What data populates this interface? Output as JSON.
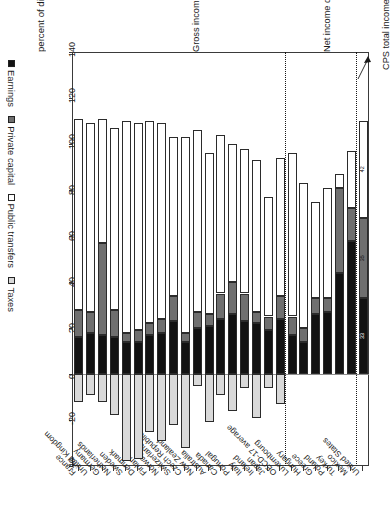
{
  "chart_data": {
    "type": "bar",
    "orientation": "horizontal-stacked",
    "title": "",
    "xlabel": "percent of disposable income",
    "ylabel": "",
    "xlim": [
      -40,
      140
    ],
    "xticks": [
      140,
      120,
      100,
      80,
      60,
      40,
      20,
      0,
      -20,
      -40
    ],
    "grid": false,
    "legend_position": "bottom",
    "legend": [
      "Earnings",
      "Private capital",
      "Public transfers",
      "Taxes"
    ],
    "colors": {
      "earnings": "#121212",
      "private_capital": "#6f6f6f",
      "public_transfers": "#ffffff",
      "taxes": "#d9d9d9"
    },
    "categories": [
      "United States",
      "Mexico",
      "Turkey",
      "Poland",
      "Greece",
      "Hungary",
      "Luxembourg",
      "OECD-17 average",
      "Japan",
      "Ireland",
      "Italy",
      "Portugal",
      "Canada",
      "Australia",
      "New Zealand",
      "Czech Republic",
      "Switzerland",
      "Norway",
      "Finland",
      "Denmark",
      "Sweden",
      "Netherlands",
      "Germany",
      "United Kingdom",
      "France"
    ],
    "series": [
      {
        "name": "Earnings",
        "values": [
          33,
          58,
          44,
          27,
          26,
          14,
          17,
          24,
          19,
          22,
          23,
          26,
          24,
          21,
          20,
          14,
          23,
          18,
          17,
          14,
          14,
          16,
          17,
          18,
          16
        ]
      },
      {
        "name": "Private capital",
        "values": [
          35,
          14,
          37,
          6,
          7,
          6,
          8,
          10,
          6,
          5,
          12,
          14,
          11,
          5,
          7,
          4,
          11,
          6,
          5,
          5,
          4,
          12,
          40,
          9,
          12
        ]
      },
      {
        "name": "Public transfers",
        "values": [
          42,
          25,
          6,
          48,
          42,
          63,
          71,
          60,
          52,
          66,
          63,
          60,
          69,
          70,
          79,
          85,
          69,
          85,
          88,
          90,
          92,
          79,
          54,
          82,
          83
        ]
      },
      {
        "name": "Taxes",
        "values": [
          0,
          0,
          0,
          0,
          0,
          0,
          0,
          -13,
          -6,
          -19,
          -6,
          -16,
          -9,
          -21,
          -5,
          -32,
          -22,
          -29,
          -25,
          -37,
          -38,
          -18,
          -12,
          -9,
          -12
        ]
      }
    ],
    "data_labels": {
      "row": "United States",
      "public_transfers": "42",
      "private_capital": "35",
      "earnings": "33"
    },
    "annotations": [
      {
        "id": "cps",
        "text": "CPS total income data"
      },
      {
        "id": "net",
        "text": "Net income data"
      },
      {
        "id": "gross",
        "text": "Gross income data"
      }
    ],
    "notes": {
      "net_income_group": [
        "Mexico",
        "Turkey",
        "Poland",
        "Greece",
        "Hungary",
        "Luxembourg"
      ],
      "gross_income_group": [
        "OECD-17 average",
        "Japan",
        "Ireland",
        "Italy",
        "Portugal",
        "Canada",
        "Australia",
        "New Zealand",
        "Czech Republic",
        "Switzerland",
        "Norway",
        "Finland",
        "Denmark",
        "Sweden",
        "Netherlands",
        "Germany",
        "United Kingdom",
        "France"
      ]
    }
  }
}
